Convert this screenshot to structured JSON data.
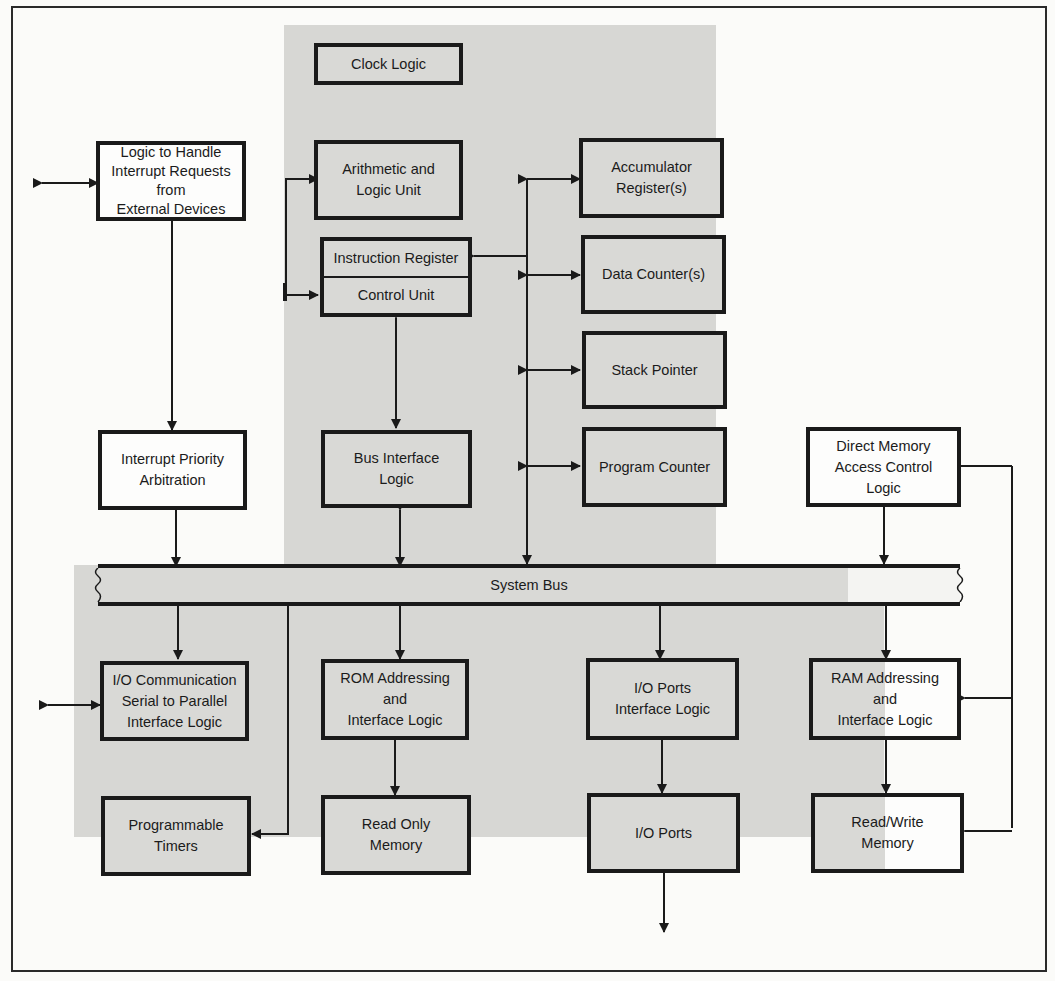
{
  "diagram": {
    "colors": {
      "cpu_shade": "#d7d7d4",
      "background": "#fbfbf9",
      "line": "#1a1a1a"
    },
    "blocks": {
      "clock_logic": {
        "lines": [
          "Clock Logic"
        ]
      },
      "alu": {
        "lines": [
          "Arithmetic and",
          "Logic Unit"
        ]
      },
      "instruction_register": {
        "lines": [
          "Instruction Register"
        ]
      },
      "control_unit": {
        "lines": [
          "Control Unit"
        ]
      },
      "bus_interface": {
        "lines": [
          "Bus Interface",
          "Logic"
        ]
      },
      "accumulator": {
        "lines": [
          "Accumulator",
          "Register(s)"
        ]
      },
      "data_counters": {
        "lines": [
          "Data Counter(s)"
        ]
      },
      "stack_pointer": {
        "lines": [
          "Stack Pointer"
        ]
      },
      "program_counter": {
        "lines": [
          "Program Counter"
        ]
      },
      "interrupt_logic": {
        "lines": [
          "Logic to Handle",
          "Interrupt Requests",
          "from",
          "External Devices"
        ]
      },
      "interrupt_priority": {
        "lines": [
          "Interrupt Priority",
          "Arbitration"
        ]
      },
      "dma": {
        "lines": [
          "Direct Memory",
          "Access Control",
          "Logic"
        ]
      },
      "system_bus": {
        "lines": [
          "System Bus"
        ]
      },
      "io_comm": {
        "lines": [
          "I/O Communication",
          "Serial to Parallel",
          "Interface Logic"
        ]
      },
      "timers": {
        "lines": [
          "Programmable",
          "Timers"
        ]
      },
      "rom_addr": {
        "lines": [
          "ROM Addressing",
          "and",
          "Interface Logic"
        ]
      },
      "rom": {
        "lines": [
          "Read Only",
          "Memory"
        ]
      },
      "io_ports_iface": {
        "lines": [
          "I/O Ports",
          "Interface Logic"
        ]
      },
      "io_ports": {
        "lines": [
          "I/O Ports"
        ]
      },
      "ram_addr": {
        "lines": [
          "RAM Addressing",
          "and",
          "Interface Logic"
        ]
      },
      "ram": {
        "lines": [
          "Read/Write",
          "Memory"
        ]
      }
    }
  }
}
